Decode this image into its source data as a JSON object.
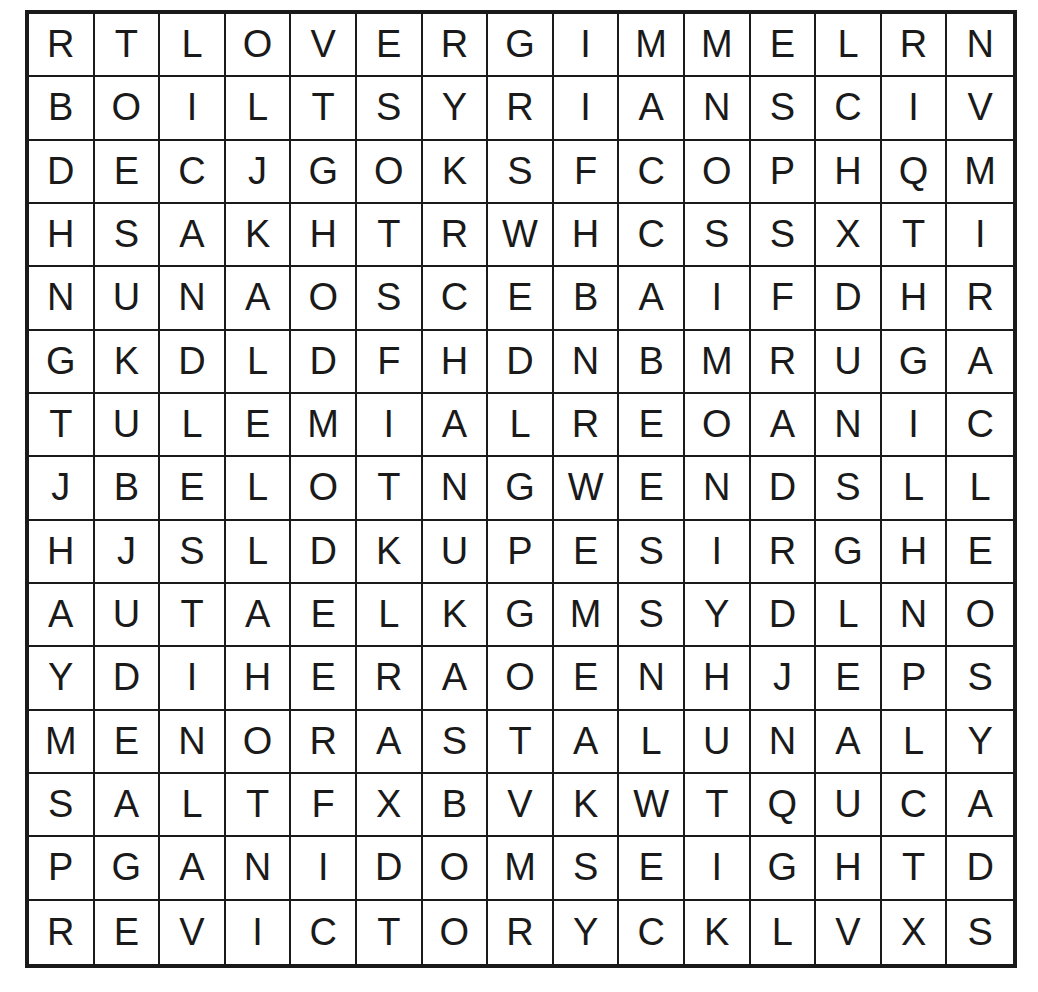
{
  "puzzle": {
    "type": "word-search",
    "rows": 15,
    "cols": 15,
    "colors": {
      "grid_line": "#1a1a1a",
      "letter": "#1a1a1a",
      "background": "#ffffff"
    },
    "grid": [
      [
        "R",
        "T",
        "L",
        "O",
        "V",
        "E",
        "R",
        "G",
        "I",
        "M",
        "M",
        "E",
        "L",
        "R",
        "N"
      ],
      [
        "B",
        "O",
        "I",
        "L",
        "T",
        "S",
        "Y",
        "R",
        "I",
        "A",
        "N",
        "S",
        "C",
        "I",
        "V"
      ],
      [
        "D",
        "E",
        "C",
        "J",
        "G",
        "O",
        "K",
        "S",
        "F",
        "C",
        "O",
        "P",
        "H",
        "Q",
        "M"
      ],
      [
        "H",
        "S",
        "A",
        "K",
        "H",
        "T",
        "R",
        "W",
        "H",
        "C",
        "S",
        "S",
        "X",
        "T",
        "I"
      ],
      [
        "N",
        "U",
        "N",
        "A",
        "O",
        "S",
        "C",
        "E",
        "B",
        "A",
        "I",
        "F",
        "D",
        "H",
        "R"
      ],
      [
        "G",
        "K",
        "D",
        "L",
        "D",
        "F",
        "H",
        "D",
        "N",
        "B",
        "M",
        "R",
        "U",
        "G",
        "A"
      ],
      [
        "T",
        "U",
        "L",
        "E",
        "M",
        "I",
        "A",
        "L",
        "R",
        "E",
        "O",
        "A",
        "N",
        "I",
        "C"
      ],
      [
        "J",
        "B",
        "E",
        "L",
        "O",
        "T",
        "N",
        "G",
        "W",
        "E",
        "N",
        "D",
        "S",
        "L",
        "L"
      ],
      [
        "H",
        "J",
        "S",
        "L",
        "D",
        "K",
        "U",
        "P",
        "E",
        "S",
        "I",
        "R",
        "G",
        "H",
        "E"
      ],
      [
        "A",
        "U",
        "T",
        "A",
        "E",
        "L",
        "K",
        "G",
        "M",
        "S",
        "Y",
        "D",
        "L",
        "N",
        "O"
      ],
      [
        "Y",
        "D",
        "I",
        "H",
        "E",
        "R",
        "A",
        "O",
        "E",
        "N",
        "H",
        "J",
        "E",
        "P",
        "S"
      ],
      [
        "M",
        "E",
        "N",
        "O",
        "R",
        "A",
        "S",
        "T",
        "A",
        "L",
        "U",
        "N",
        "A",
        "L",
        "Y"
      ],
      [
        "S",
        "A",
        "L",
        "T",
        "F",
        "X",
        "B",
        "V",
        "K",
        "W",
        "T",
        "Q",
        "U",
        "C",
        "A"
      ],
      [
        "P",
        "G",
        "A",
        "N",
        "I",
        "D",
        "O",
        "M",
        "S",
        "E",
        "I",
        "G",
        "H",
        "T",
        "D"
      ],
      [
        "R",
        "E",
        "V",
        "I",
        "C",
        "T",
        "O",
        "R",
        "Y",
        "C",
        "K",
        "L",
        "V",
        "X",
        "S"
      ]
    ]
  }
}
